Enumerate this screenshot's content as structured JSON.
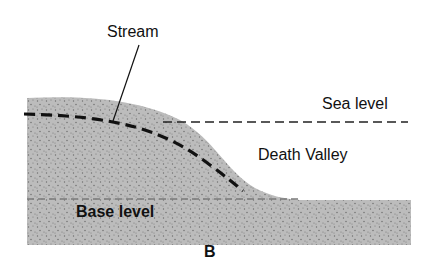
{
  "diagram": {
    "panel_label": "B",
    "labels": {
      "stream": "Stream",
      "sea_level": "Sea level",
      "death_valley": "Death Valley",
      "base_level": "Base level"
    },
    "colors": {
      "ground_fill": "#b9b9b9",
      "stipple": "#6e6e6e",
      "stream_line": "#111111",
      "sea_level_line": "#222222",
      "base_level_line": "#7a7a7a"
    }
  }
}
